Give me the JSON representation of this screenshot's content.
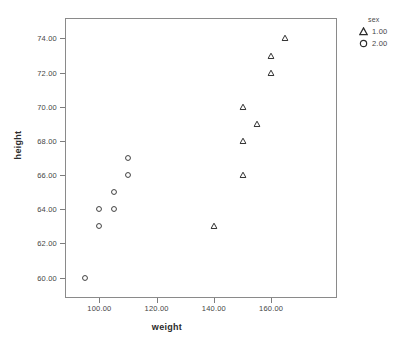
{
  "chart_data": {
    "type": "scatter",
    "title": "",
    "xlabel": "weight",
    "ylabel": "height",
    "xlim": [
      88,
      183
    ],
    "ylim": [
      58.8,
      75.2
    ],
    "grid": false,
    "xticks": [
      "100.00",
      "120.00",
      "140.00",
      "160.00"
    ],
    "xtick_values": [
      100,
      120,
      140,
      160
    ],
    "yticks": [
      "60.00",
      "62.00",
      "64.00",
      "66.00",
      "68.00",
      "70.00",
      "72.00",
      "74.00"
    ],
    "ytick_values": [
      60,
      62,
      64,
      66,
      68,
      70,
      72,
      74
    ],
    "legend": {
      "title": "sex",
      "position": "right-top",
      "entries": [
        {
          "label": "1.00",
          "marker": "triangle"
        },
        {
          "label": "2.00",
          "marker": "circle"
        }
      ]
    },
    "series": [
      {
        "name": "1.00",
        "marker": "triangle",
        "points": [
          {
            "x": 140,
            "y": 63
          },
          {
            "x": 150,
            "y": 66
          },
          {
            "x": 150,
            "y": 68
          },
          {
            "x": 150,
            "y": 70
          },
          {
            "x": 155,
            "y": 69
          },
          {
            "x": 160,
            "y": 72
          },
          {
            "x": 160,
            "y": 73
          },
          {
            "x": 165,
            "y": 74
          }
        ]
      },
      {
        "name": "2.00",
        "marker": "circle",
        "points": [
          {
            "x": 95,
            "y": 60
          },
          {
            "x": 100,
            "y": 63
          },
          {
            "x": 100,
            "y": 64
          },
          {
            "x": 105,
            "y": 64
          },
          {
            "x": 105,
            "y": 65
          },
          {
            "x": 110,
            "y": 66
          },
          {
            "x": 110,
            "y": 67
          }
        ]
      }
    ]
  }
}
